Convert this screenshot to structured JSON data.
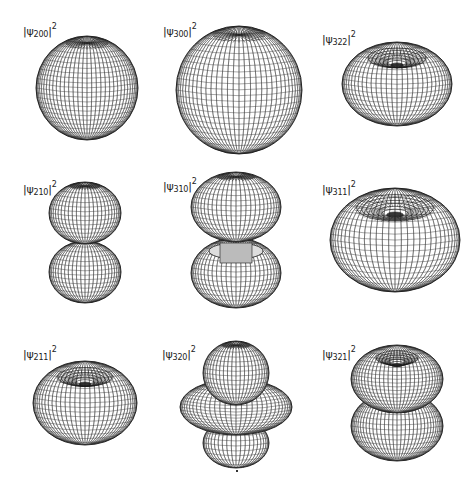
{
  "figure": {
    "panels": [
      {
        "id": "psi200",
        "label_prefix": "|ψ",
        "subscript": "200",
        "label_suffix": "|",
        "superscript": "2",
        "shape": "sphere",
        "row": 0,
        "col": 0
      },
      {
        "id": "psi300",
        "label_prefix": "|ψ",
        "subscript": "300",
        "label_suffix": "|",
        "superscript": "2",
        "shape": "sphere-large",
        "row": 0,
        "col": 1
      },
      {
        "id": "psi322",
        "label_prefix": "|ψ",
        "subscript": "322",
        "label_suffix": "|",
        "superscript": "2",
        "shape": "torus",
        "row": 0,
        "col": 2
      },
      {
        "id": "psi210",
        "label_prefix": "|ψ",
        "subscript": "210",
        "label_suffix": "|",
        "superscript": "2",
        "shape": "dumbbell",
        "row": 1,
        "col": 0
      },
      {
        "id": "psi310",
        "label_prefix": "|ψ",
        "subscript": "310",
        "label_suffix": "|",
        "superscript": "2",
        "shape": "dumbbell-with-inner-ring",
        "row": 1,
        "col": 1
      },
      {
        "id": "psi311",
        "label_prefix": "|ψ",
        "subscript": "311",
        "label_suffix": "|",
        "superscript": "2",
        "shape": "torus-large",
        "row": 1,
        "col": 2
      },
      {
        "id": "psi211",
        "label_prefix": "|ψ",
        "subscript": "211",
        "label_suffix": "|",
        "superscript": "2",
        "shape": "torus",
        "row": 2,
        "col": 0
      },
      {
        "id": "psi320",
        "label_prefix": "|ψ",
        "subscript": "320",
        "label_suffix": "|",
        "superscript": "2",
        "shape": "dumbbell-with-ring",
        "row": 2,
        "col": 1
      },
      {
        "id": "psi321",
        "label_prefix": "|ψ",
        "subscript": "321",
        "label_suffix": "|",
        "superscript": "2",
        "shape": "double-torus",
        "row": 2,
        "col": 2
      }
    ],
    "colors": {
      "wire": "#1a1a1a",
      "background": "#ffffff",
      "fill": "#ffffff"
    }
  }
}
